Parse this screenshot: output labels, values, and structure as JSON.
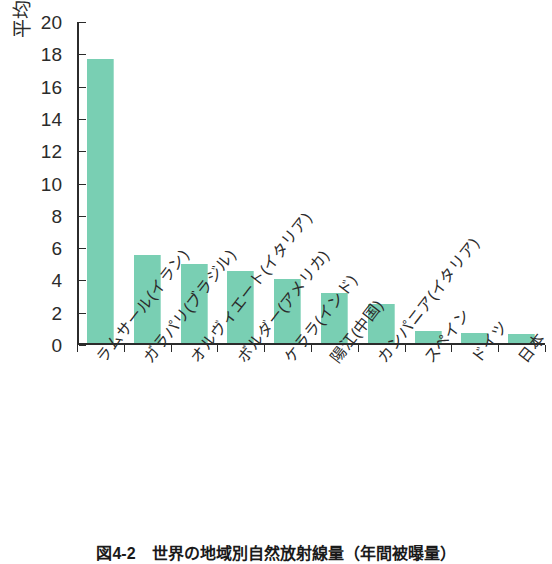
{
  "chart_data": {
    "type": "bar",
    "title": "",
    "xlabel": "",
    "ylabel": "平均値(mSv/年)",
    "ylim": [
      0,
      20
    ],
    "ytick_step": 2,
    "yticks": [
      0,
      2,
      4,
      6,
      8,
      10,
      12,
      14,
      16,
      18,
      20
    ],
    "grid": false,
    "legend": null,
    "bar_color": "#79cfb3",
    "axis_color": "#2b2b2b",
    "categories": [
      "ラムサール(イラン)",
      "ガラパリ(ブラジル)",
      "オルヴィエート(イタリア)",
      "ボルダー(アメリカ)",
      "ケララ(インド)",
      "陽江(中国)",
      "カンパニア(イタリア)",
      "スペイン",
      "ドイツ",
      "日本"
    ],
    "values": [
      17.6,
      5.45,
      4.9,
      4.45,
      3.95,
      3.1,
      2.4,
      0.75,
      0.65,
      0.55
    ],
    "units": "mSv/年"
  },
  "axis": {
    "y_label": "平均値(mSv/年)",
    "y_tick_labels": [
      "20",
      "18",
      "16",
      "14",
      "12",
      "10",
      "8",
      "6",
      "4",
      "2",
      "0"
    ]
  },
  "caption": {
    "text": "図4-2　世界の地域別自然放射線量（年間被曝量）"
  }
}
